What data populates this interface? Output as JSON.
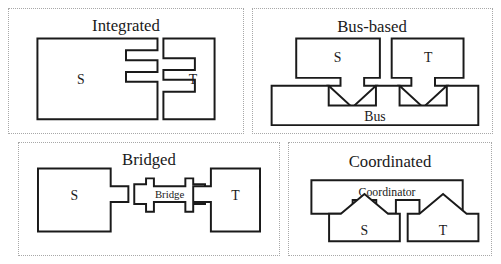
{
  "figure": {
    "layout": "2x2 grid of dotted-bordered panels",
    "panels": [
      {
        "id": "integrated",
        "title": "Integrated",
        "description": "Two interlocking comb-shaped boxes whose fingers mesh together",
        "nodes": [
          {
            "label": "S"
          },
          {
            "label": "T"
          }
        ]
      },
      {
        "id": "bus-based",
        "title": "Bus-based",
        "description": "Two boxes with downward arrow connectors plugging into notches in a shared bus",
        "nodes": [
          {
            "label": "S"
          },
          {
            "label": "T"
          },
          {
            "label": "Bus"
          }
        ]
      },
      {
        "id": "bridged",
        "title": "Bridged",
        "description": "Two boxes with protruding tabs joined by an I-beam bridge element with sockets",
        "nodes": [
          {
            "label": "S"
          },
          {
            "label": "T"
          },
          {
            "label": "Bridge"
          }
        ]
      },
      {
        "id": "coordinated",
        "title": "Coordinated",
        "description": "Two lower boxes with upward arrow connectors plugging into notches in a coordinator box above",
        "nodes": [
          {
            "label": "Coordinator"
          },
          {
            "label": "S"
          },
          {
            "label": "T"
          }
        ]
      }
    ]
  },
  "colors": {
    "stroke": "#1a1a1a",
    "fill": "#ffffff",
    "panel_border": "#a8a8a8",
    "background": "#ffffff"
  }
}
